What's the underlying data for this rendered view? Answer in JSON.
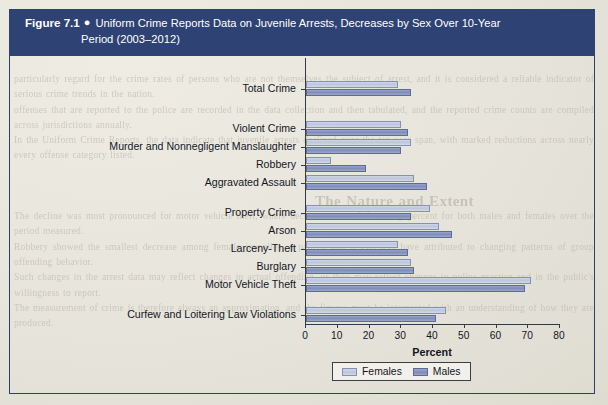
{
  "figure": {
    "number_label": "Figure 7.1",
    "bullet": "●",
    "caption_line1": "Uniform Crime Reports Data on Juvenile Arrests, Decreases by Sex Over 10-Year",
    "caption_line2": "Period (2003–2012)"
  },
  "colors": {
    "banner": "#2e4274",
    "border": "#2e3f6e",
    "females": "#c6cee4",
    "males": "#8793bd",
    "axis": "#333a46",
    "page": "#e8e6df"
  },
  "legend": {
    "position": "bottom-center",
    "items": [
      {
        "label": "Females",
        "series": "females"
      },
      {
        "label": "Males",
        "series": "males"
      }
    ]
  },
  "chart_data": {
    "type": "bar",
    "orientation": "horizontal",
    "title": "Uniform Crime Reports Data on Juvenile Arrests, Decreases by Sex Over 10-Year Period (2003–2012)",
    "xlabel": "Percent",
    "ylabel": "",
    "xlim": [
      0,
      80
    ],
    "xticks": [
      0,
      10,
      20,
      30,
      40,
      50,
      60,
      70,
      80
    ],
    "grid": false,
    "legend_entries": [
      "Females",
      "Males"
    ],
    "categories": [
      "Total Crime",
      "Violent Crime",
      "Murder and Nonnegligent Manslaughter",
      "Robbery",
      "Aggravated Assault",
      "Property Crime",
      "Arson",
      "Larceny-Theft",
      "Burglary",
      "Motor Vehicle Theft",
      "Curfew and Loitering Law Violations"
    ],
    "series": [
      {
        "name": "Females",
        "values": [
          29,
          30,
          33,
          8,
          34,
          39,
          42,
          29,
          33,
          71,
          44
        ]
      },
      {
        "name": "Males",
        "values": [
          33,
          32,
          30,
          19,
          38,
          33,
          46,
          32,
          34,
          69,
          41
        ]
      }
    ]
  },
  "ghost_page_text": {
    "heading": "The Nature and Extent",
    "lines": [
      "particularly regard for the crime rates of persons who are not themselves the subject of arrest, and it is considered a reliable indicator of serious crime trends in the nation.",
      "offenses that are reported to the police are recorded in the data collection and then tabulated, and the reported crime counts are compiled across jurisdictions annually.",
      "In the Uniform Crime Reports, the data indicate that juvenile arrests declined over the ten-year span, with marked reductions across nearly every offense category listed.",
      "The decline was most pronounced for motor vehicle theft, where decreases exceeded seventy percent for both males and females over the period measured.",
      "Robbery showed the smallest decrease among female juveniles, a pattern that researchers have attributed to changing patterns of group offending behavior.",
      "Such changes in the arrest data may reflect changes in actual offending, or they may reflect changes in police practice and in the public's willingness to report.",
      "The measurement of crime is therefore always an approximation, and the figures must be interpreted with an understanding of how they are produced."
    ]
  }
}
